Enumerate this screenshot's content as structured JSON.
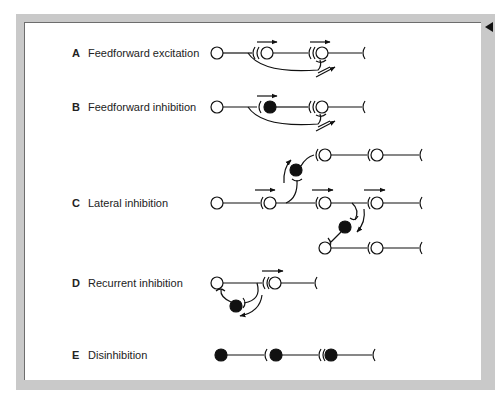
{
  "figure": {
    "rows": [
      {
        "letter": "A",
        "title": "Feedforward excitation"
      },
      {
        "letter": "B",
        "title": "Feedforward inhibition"
      },
      {
        "letter": "C",
        "title": "Lateral inhibition"
      },
      {
        "letter": "D",
        "title": "Recurrent inhibition"
      },
      {
        "letter": "E",
        "title": "Disinhibition"
      }
    ],
    "legend": {
      "open_circle": "excitatory neuron",
      "filled_circle": "inhibitory neuron"
    }
  }
}
